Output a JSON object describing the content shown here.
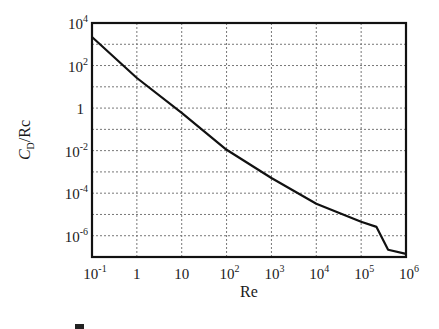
{
  "chart_data": {
    "type": "line",
    "title": "",
    "xlabel": "Re",
    "ylabel": "C_D/Rc",
    "ylabel_parts": {
      "main": "C",
      "sub": "D",
      "rest": "/Rc"
    },
    "xscale": "log",
    "yscale": "log",
    "xlim": [
      0.1,
      1000000
    ],
    "ylim": [
      1e-07,
      10000
    ],
    "grid": true,
    "legend": null,
    "x_ticks": [
      {
        "base": "10",
        "exp": "-1",
        "value": 0.1
      },
      {
        "base": "1",
        "exp": "",
        "value": 1
      },
      {
        "base": "10",
        "exp": "",
        "value": 10
      },
      {
        "base": "10",
        "exp": "2",
        "value": 100
      },
      {
        "base": "10",
        "exp": "3",
        "value": 1000
      },
      {
        "base": "10",
        "exp": "4",
        "value": 10000
      },
      {
        "base": "10",
        "exp": "5",
        "value": 100000
      },
      {
        "base": "10",
        "exp": "6",
        "value": 1000000
      }
    ],
    "y_ticks": [
      {
        "base": "10",
        "exp": "4",
        "value": 10000
      },
      {
        "base": "10",
        "exp": "2",
        "value": 100
      },
      {
        "base": "1",
        "exp": "",
        "value": 1
      },
      {
        "base": "10",
        "exp": "-2",
        "value": 0.01
      },
      {
        "base": "10",
        "exp": "-4",
        "value": 0.0001
      },
      {
        "base": "10",
        "exp": "-6",
        "value": 1e-06
      }
    ],
    "series": [
      {
        "name": "C_D/Re",
        "x": [
          0.1,
          1,
          10,
          100,
          1000,
          10000,
          100000,
          220000,
          400000,
          1000000
        ],
        "y": [
          2200,
          26,
          0.6,
          0.011,
          0.00052,
          3.2e-05,
          4.5e-06,
          2.6e-06,
          2.2e-07,
          1.4e-07
        ]
      }
    ],
    "caption_partial": "图 1-xx  C_D/Re 与 Re 的关系 (caption clipped at bottom edge)"
  }
}
